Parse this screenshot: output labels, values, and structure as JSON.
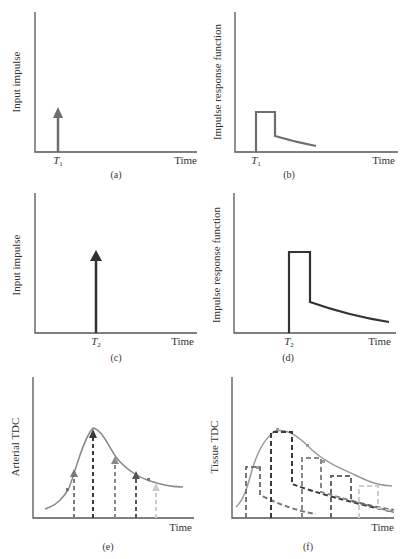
{
  "figure": {
    "panels": [
      {
        "id": "a",
        "caption": "(a)",
        "ylabel": "Input impulse",
        "xlabel": "Time",
        "marker": "T",
        "marker_sub": "1"
      },
      {
        "id": "b",
        "caption": "(b)",
        "ylabel": "Impulse response function",
        "xlabel": "Time",
        "marker": "T",
        "marker_sub": "1"
      },
      {
        "id": "c",
        "caption": "(c)",
        "ylabel": "Input impulse",
        "xlabel": "Time",
        "marker": "T",
        "marker_sub": "2"
      },
      {
        "id": "d",
        "caption": "(d)",
        "ylabel": "Impulse response function",
        "xlabel": "Time",
        "marker": "T",
        "marker_sub": "2"
      },
      {
        "id": "e",
        "caption": "(e)",
        "ylabel": "Arterial TDC",
        "xlabel": "Time"
      },
      {
        "id": "f",
        "caption": "(f)",
        "ylabel": "Tissue TDC",
        "xlabel": "Time"
      }
    ],
    "colors": {
      "axis": "#555555",
      "impulse_small": "#6e6e6e",
      "impulse_large": "#333333",
      "curve": "#888888"
    }
  }
}
